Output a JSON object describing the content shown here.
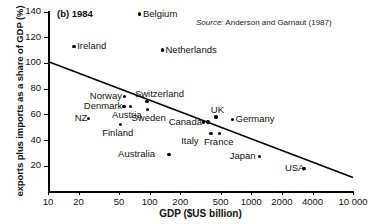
{
  "figure": {
    "panel_title": "(b) 1984",
    "source_label": "Source:",
    "source_text": " Anderson and Garnaut (1987)",
    "x_axis_title": "GDP ($US billion)",
    "y_axis_title": "exports plus imports as a share of GDP (%)"
  },
  "chart_data": {
    "type": "scatter",
    "title": "(b) 1984",
    "xlabel": "GDP ($US billion)",
    "ylabel": "exports plus imports as a share of GDP (%)",
    "xscale": "log",
    "yscale": "linear",
    "xlim": [
      10,
      10000
    ],
    "ylim": [
      0,
      140
    ],
    "grid": false,
    "legend": null,
    "xticks": [
      10,
      20,
      50,
      100,
      200,
      500,
      1000,
      2000,
      4000,
      10000
    ],
    "xticklabels": [
      "10",
      "20",
      "50",
      "100",
      "200",
      "500",
      "1000",
      "2000",
      "4000",
      "10 000"
    ],
    "yticks": [
      20,
      40,
      60,
      80,
      100,
      120,
      140
    ],
    "yticklabels": [
      "20",
      "40",
      "60",
      "80",
      "100",
      "120",
      "140"
    ],
    "annotation": "Source: Anderson and Garnaut (1987)",
    "points": [
      {
        "name": "Belgium",
        "x": 80,
        "y": 138,
        "label_pos": "right"
      },
      {
        "name": "Ireland",
        "x": 18,
        "y": 113,
        "label_pos": "right"
      },
      {
        "name": "Netherlands",
        "x": 133,
        "y": 110,
        "label_pos": "right"
      },
      {
        "name": "Norway",
        "x": 57,
        "y": 74,
        "label_pos": "left"
      },
      {
        "name": "Switzerland",
        "x": 94,
        "y": 70,
        "label_pos": "right-above"
      },
      {
        "name": "Denmark",
        "x": 56,
        "y": 66,
        "label_pos": "left"
      },
      {
        "name": "Austria",
        "x": 65,
        "y": 66,
        "label_pos": "below"
      },
      {
        "name": "Sweden",
        "x": 95,
        "y": 64,
        "label_pos": "below"
      },
      {
        "name": "NZ",
        "x": 25,
        "y": 57,
        "label_pos": "left"
      },
      {
        "name": "UK",
        "x": 450,
        "y": 58,
        "label_pos": "above"
      },
      {
        "name": "Germany",
        "x": 650,
        "y": 56,
        "label_pos": "right"
      },
      {
        "name": "Canada",
        "x": 340,
        "y": 54,
        "label_pos": "left"
      },
      {
        "name": "Canada2",
        "x": 375,
        "y": 54,
        "label_pos": "none"
      },
      {
        "name": "Finland",
        "x": 52,
        "y": 52,
        "label_pos": "below"
      },
      {
        "name": "France",
        "x": 490,
        "y": 45,
        "label_pos": "below"
      },
      {
        "name": "Italy",
        "x": 400,
        "y": 45,
        "label_pos": "left-below"
      },
      {
        "name": "Australia",
        "x": 155,
        "y": 29,
        "label_pos": "left"
      },
      {
        "name": "Japan",
        "x": 1200,
        "y": 27,
        "label_pos": "left"
      },
      {
        "name": "USA",
        "x": 3300,
        "y": 18,
        "label_pos": "left"
      }
    ],
    "trendline": {
      "x": [
        10,
        10000
      ],
      "y": [
        101,
        11
      ]
    }
  }
}
